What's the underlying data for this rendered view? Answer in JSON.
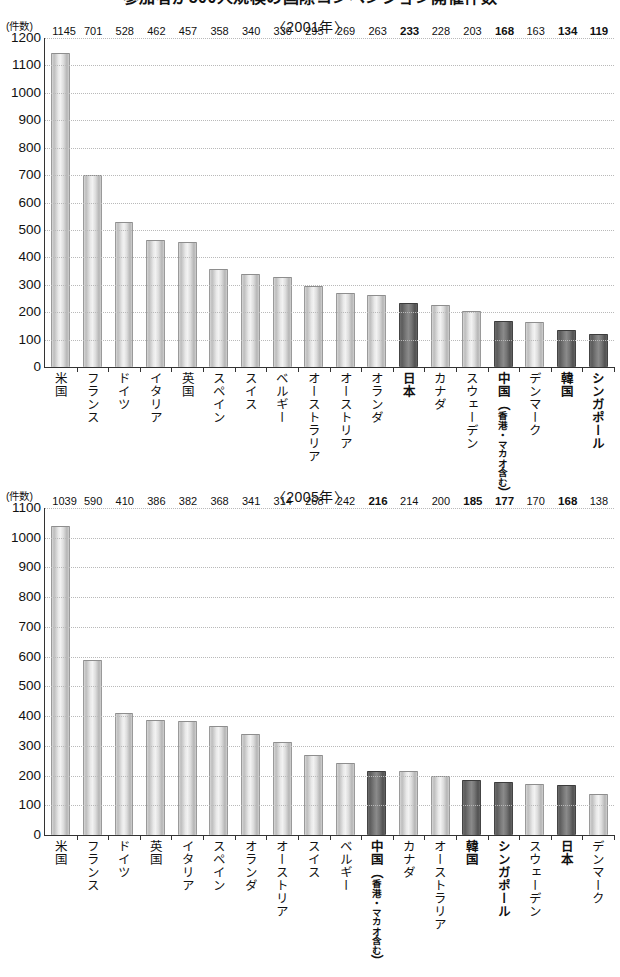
{
  "title": "参加者が500人規模の国際コンベンション開催件数",
  "unit_label": "(件数)",
  "highlight_color": "#6a6a6a",
  "bar_color": "#d9d9d9",
  "chart_data": [
    {
      "type": "bar",
      "title": "〈2001年〉",
      "ylabel": "(件数)",
      "xlabel": "",
      "ylim": [
        0,
        1200
      ],
      "ytick_step": 100,
      "yticks": [
        0,
        100,
        200,
        300,
        400,
        500,
        600,
        700,
        800,
        900,
        1000,
        1100,
        1200
      ],
      "grid": true,
      "legend": "none",
      "categories": [
        "米国",
        "フランス",
        "ドイツ",
        "イタリア",
        "英国",
        "スペイン",
        "スイス",
        "ベルギー",
        "オーストラリア",
        "オーストリア",
        "オランダ",
        "日本",
        "カナダ",
        "スウェーデン",
        "中国（香港・マカオ含む）",
        "デンマーク",
        "韓国",
        "シンガポール"
      ],
      "values": [
        1145,
        701,
        528,
        462,
        457,
        358,
        340,
        330,
        295,
        269,
        263,
        233,
        228,
        203,
        168,
        163,
        134,
        119
      ],
      "highlighted": [
        false,
        false,
        false,
        false,
        false,
        false,
        false,
        false,
        false,
        false,
        false,
        true,
        false,
        false,
        true,
        false,
        true,
        true
      ]
    },
    {
      "type": "bar",
      "title": "〈2005年〉",
      "ylabel": "(件数)",
      "xlabel": "",
      "ylim": [
        0,
        1100
      ],
      "ytick_step": 100,
      "yticks": [
        0,
        100,
        200,
        300,
        400,
        500,
        600,
        700,
        800,
        900,
        1000,
        1100
      ],
      "grid": true,
      "legend": "none",
      "categories": [
        "米国",
        "フランス",
        "ドイツ",
        "英国",
        "イタリア",
        "スペイン",
        "オランダ",
        "オーストリア",
        "スイス",
        "ベルギー",
        "中国（香港・マカオ含む）",
        "カナダ",
        "オーストラリア",
        "韓国",
        "シンガポール",
        "スウェーデン",
        "日本",
        "デンマーク"
      ],
      "values": [
        1039,
        590,
        410,
        386,
        382,
        368,
        341,
        314,
        268,
        242,
        216,
        214,
        200,
        185,
        177,
        170,
        168,
        138
      ],
      "highlighted": [
        false,
        false,
        false,
        false,
        false,
        false,
        false,
        false,
        false,
        false,
        true,
        false,
        false,
        true,
        true,
        false,
        true,
        false
      ]
    }
  ]
}
